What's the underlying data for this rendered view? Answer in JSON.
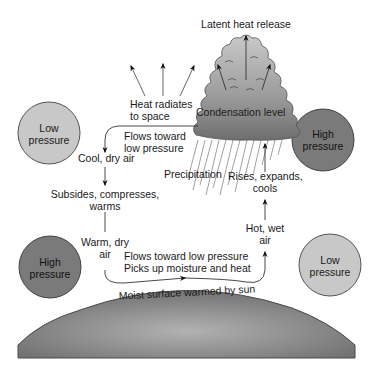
{
  "diagram": {
    "type": "atmospheric-circulation",
    "colors": {
      "background": "#ffffff",
      "low_pressure_fill": "#c8c8c8",
      "high_pressure_fill": "#7a7a7a",
      "cloud_top": "#c4c4c4",
      "cloud_bottom": "#6e6e6e",
      "ground_light": "#b0b0b0",
      "ground_dark": "#6a6a6a",
      "stroke": "#333333",
      "text": "#1a1a1a"
    },
    "pressure_cells": [
      {
        "id": "low-top-left",
        "label": "Low\npressure",
        "kind": "low"
      },
      {
        "id": "high-top-right",
        "label": "High\npressure",
        "kind": "high"
      },
      {
        "id": "high-bottom-left",
        "label": "High\npressure",
        "kind": "high"
      },
      {
        "id": "low-bottom-right",
        "label": "Low\npressure",
        "kind": "low"
      }
    ],
    "labels": {
      "latent_heat": "Latent heat release",
      "heat_radiates_1": "Heat radiates",
      "heat_radiates_2": "to space",
      "condensation": "Condensation level",
      "flows_toward_1": "Flows toward",
      "flows_toward_2": "low pressure",
      "cool_dry": "Cool, dry air",
      "precipitation": "Precipitation",
      "rises_1": "Rises, expands,",
      "rises_2": "cools",
      "subsides_1": "Subsides, compresses,",
      "subsides_2": "warms",
      "warm_dry_1": "Warm, dry",
      "warm_dry_2": "air",
      "hot_wet_1": "Hot, wet",
      "hot_wet_2": "air",
      "surface_flow_1": "Flows toward low pressure",
      "surface_flow_2": "Picks up moisture and heat",
      "moist_surface": "Moist surface warmed by sun"
    }
  }
}
